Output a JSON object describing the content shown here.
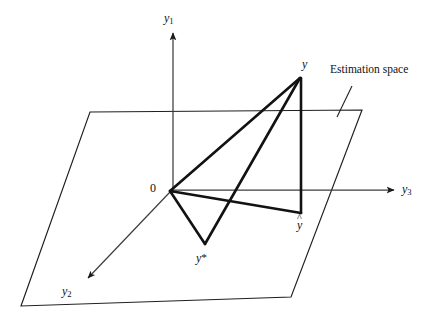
{
  "figure": {
    "background_color": "#ffffff",
    "line_color": "#1a1a1a",
    "thin_line_color": "#3a3a3a",
    "axes": [
      {
        "id": "y1",
        "base": "y",
        "subscript": "1",
        "label": "y1",
        "direction": "up"
      },
      {
        "id": "y2",
        "base": "y",
        "subscript": "2",
        "label": "y2",
        "direction": "down-left"
      },
      {
        "id": "y3",
        "base": "y",
        "subscript": "3",
        "label": "y3",
        "direction": "right"
      }
    ],
    "origin_label": "0",
    "points": [
      {
        "id": "y",
        "label": "y",
        "kind": "observation-vector-tip",
        "x": 300,
        "y": 77
      },
      {
        "id": "yhat",
        "label": "y",
        "accent": "hat",
        "kind": "projection-point",
        "x": 300,
        "y": 213
      },
      {
        "id": "ystar",
        "label": "y",
        "accent": "star",
        "kind": "alternative-estimate-point",
        "x": 205,
        "y": 243
      },
      {
        "id": "origin",
        "label": "0",
        "kind": "origin",
        "x": 170,
        "y": 191
      }
    ],
    "annotation": {
      "text": "Estimation space",
      "leader_from_x": 352,
      "leader_from_y": 86,
      "leader_to_x": 337,
      "leader_to_y": 117
    },
    "plane": {
      "name": "estimation-space-plane",
      "corners": [
        {
          "x": 90,
          "y": 112
        },
        {
          "x": 362,
          "y": 110
        },
        {
          "x": 291,
          "y": 297
        },
        {
          "x": 21,
          "y": 306
        }
      ]
    }
  }
}
